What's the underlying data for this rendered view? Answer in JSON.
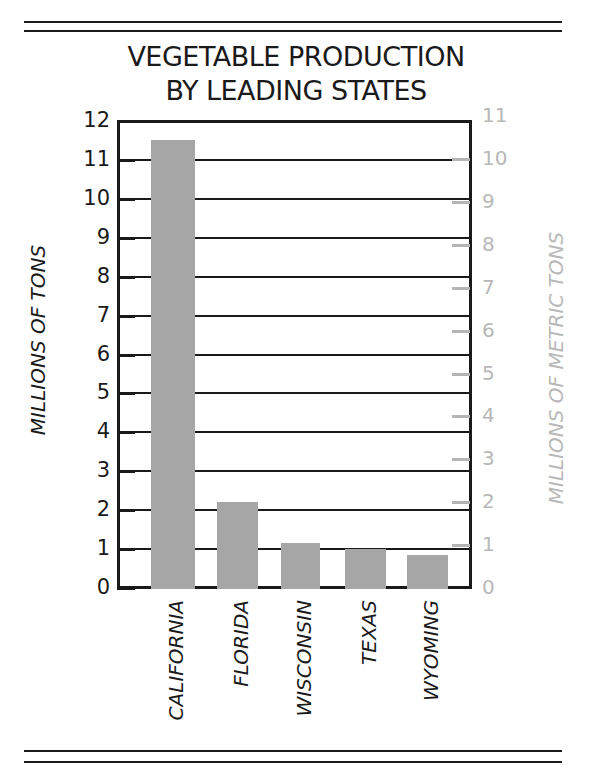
{
  "chart_data": {
    "type": "bar",
    "title": "VEGETABLE PRODUCTION BY LEADING STATES",
    "title_lines": [
      "VEGETABLE PRODUCTION",
      "BY LEADING STATES"
    ],
    "categories": [
      "CALIFORNIA",
      "FLORIDA",
      "WISCONSIN",
      "TEXAS",
      "WYOMING"
    ],
    "values": [
      11.5,
      2.2,
      1.15,
      1.0,
      0.85
    ],
    "xlabel": "",
    "ylabel": "MILLIONS OF TONS",
    "ylabel_right": "MILLIONS OF METRIC TONS",
    "ylim": [
      0,
      12
    ],
    "ylim_right": [
      0,
      11
    ],
    "yticks": [
      "0",
      "1",
      "2",
      "3",
      "4",
      "5",
      "6",
      "7",
      "8",
      "9",
      "10",
      "11",
      "12"
    ],
    "yticks_right": [
      "0",
      "1",
      "2",
      "3",
      "4",
      "5",
      "6",
      "7",
      "8",
      "9",
      "10",
      "11"
    ],
    "grid": true,
    "legend": null,
    "colors": {
      "bar": "#a6a6a6",
      "axis": "#1a1a1a",
      "right_axis": "#b8b8b8"
    }
  }
}
